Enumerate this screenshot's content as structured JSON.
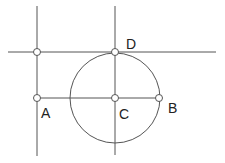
{
  "diagram": {
    "colors": {
      "stroke": "#555555",
      "point_fill": "#ffffff",
      "label": "#222222",
      "background": "#ffffff"
    },
    "lines": [
      {
        "id": "left-vertical",
        "x1": 37,
        "y1": 6,
        "x2": 37,
        "y2": 156
      },
      {
        "id": "center-vertical",
        "x1": 115,
        "y1": 6,
        "x2": 115,
        "y2": 155
      },
      {
        "id": "top-horizontal",
        "x1": 8,
        "y1": 52,
        "x2": 216,
        "y2": 52
      },
      {
        "id": "segment-AB",
        "x1": 37,
        "y1": 98,
        "x2": 159,
        "y2": 98
      }
    ],
    "circle": {
      "id": "circle-C",
      "cx": 115,
      "cy": 98,
      "r": 45
    },
    "points": [
      {
        "id": "intersection-top-left",
        "x": 37,
        "y": 52,
        "label": ""
      },
      {
        "id": "D",
        "x": 115,
        "y": 52,
        "label": "D"
      },
      {
        "id": "A",
        "x": 37,
        "y": 98,
        "label": "A"
      },
      {
        "id": "C",
        "x": 115,
        "y": 98,
        "label": "C"
      },
      {
        "id": "B",
        "x": 159,
        "y": 98,
        "label": "B"
      }
    ],
    "labels": {
      "A": {
        "text": "A",
        "x": 41,
        "y": 106
      },
      "B": {
        "text": "B",
        "x": 168,
        "y": 101
      },
      "C": {
        "text": "C",
        "x": 119,
        "y": 107
      },
      "D": {
        "text": "D",
        "x": 126,
        "y": 37
      }
    }
  }
}
